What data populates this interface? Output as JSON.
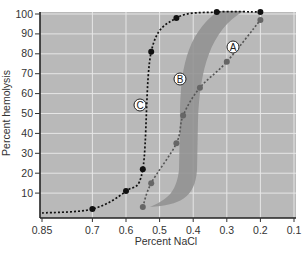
{
  "chart_data": {
    "type": "line",
    "title": "",
    "xlabel": "Percent NaCl",
    "ylabel": "Percent hemolysis",
    "xlim": [
      0.85,
      0.1
    ],
    "ylim": [
      0,
      100
    ],
    "x_reversed": true,
    "grid": true,
    "legend": "inline circled labels",
    "x_ticks": [
      "0.85",
      "0.7",
      "0.6",
      "0.5",
      "0.4",
      "0.3",
      "0.2",
      "0.1"
    ],
    "y_ticks": [
      "100",
      "90",
      "80",
      "70",
      "60",
      "50",
      "40",
      "30",
      "20",
      "10"
    ],
    "series": [
      {
        "name": "A",
        "style": "dotted line with gray markers",
        "color": "#6b6b6b",
        "x": [
          0.55,
          0.525,
          0.45,
          0.43,
          0.38,
          0.3,
          0.2
        ],
        "y": [
          3,
          15,
          35,
          49,
          63,
          76,
          97
        ]
      },
      {
        "name": "B",
        "style": "shaded band",
        "color": "#8f8f8f",
        "description": "range of hemolysis between curves, centered near 0.43-0.4 % NaCl"
      },
      {
        "name": "C",
        "style": "dotted line with black markers",
        "color": "#111111",
        "x": [
          0.85,
          0.7,
          0.6,
          0.55,
          0.525,
          0.45,
          0.33,
          0.2
        ],
        "y": [
          0,
          2,
          11,
          22,
          81,
          98,
          101,
          101
        ]
      }
    ],
    "annotations": [
      "A",
      "B",
      "C"
    ]
  },
  "labels": {
    "curve_a": "A",
    "curve_b": "B",
    "curve_c": "C",
    "x_axis_title": "Percent NaCl",
    "y_axis_title": "Percent hemolysis"
  },
  "colors": {
    "plot_bg": "#b9b9b9",
    "grid": "#e8e8e8",
    "band": "#8f8f8f",
    "curve_a": "#6b6b6b",
    "curve_c": "#111111"
  }
}
